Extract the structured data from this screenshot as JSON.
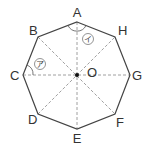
{
  "diagram": {
    "vertices": [
      {
        "label": "A",
        "x": 77,
        "y": 22
      },
      {
        "label": "H",
        "x": 115,
        "y": 37
      },
      {
        "label": "G",
        "x": 130,
        "y": 75
      },
      {
        "label": "F",
        "x": 115,
        "y": 114
      },
      {
        "label": "E",
        "x": 77,
        "y": 129
      },
      {
        "label": "D",
        "x": 38,
        "y": 114
      },
      {
        "label": "C",
        "x": 23,
        "y": 75
      },
      {
        "label": "B",
        "x": 38,
        "y": 37
      }
    ],
    "center": {
      "label": "O",
      "x": 77,
      "y": 75
    },
    "angle_marks": [
      {
        "symbol": "㋐",
        "text": "ア",
        "vertex": "C"
      },
      {
        "symbol": "㋑",
        "text": "イ",
        "vertex": "A"
      }
    ],
    "colors": {
      "stroke": "#444444",
      "dashed": "#777777",
      "text": "#333333"
    }
  }
}
